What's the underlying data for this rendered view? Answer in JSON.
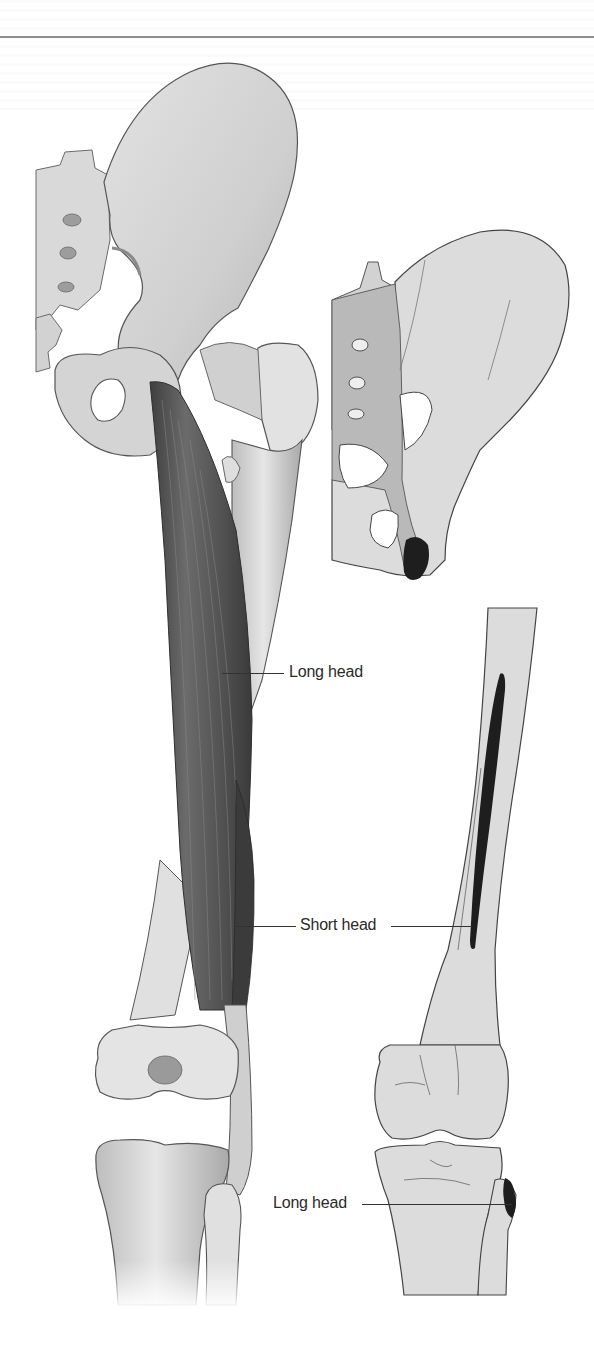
{
  "figure": {
    "views": [
      {
        "id": "main",
        "description": "Posterior view of pelvis, femur, knee with biceps femoris muscle bellies"
      },
      {
        "id": "inset-pelvis",
        "description": "Posterior pelvis showing origin of long head on ischial tuberosity"
      },
      {
        "id": "inset-femur",
        "description": "Posterior femur, knee and leg showing short head origin on linea aspera and insertion on fibular head"
      }
    ],
    "labels": {
      "long_head_upper": "Long head",
      "short_head": "Short head",
      "long_head_lower": "Long head"
    },
    "colors": {
      "muscle": "#5a5a5a",
      "bone_shaded": "#d6d6d6",
      "inset_bone": "#dcdcdc",
      "inset_ligament": "#b9b9b9",
      "attachment": "#1e1e1e",
      "outline": "#4a4a4a",
      "rule": "#8f8f8f"
    }
  }
}
